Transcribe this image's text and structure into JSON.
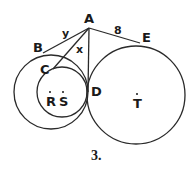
{
  "diagram": {
    "caption": "3.",
    "points": {
      "A": "A",
      "B": "B",
      "C": "C",
      "D": "D",
      "E": "E",
      "R": "R",
      "S": "S",
      "T": "T"
    },
    "segment_labels": {
      "AB": "y",
      "AC": "x",
      "AE": "8"
    },
    "stroke_color": "#2a2a2a"
  }
}
